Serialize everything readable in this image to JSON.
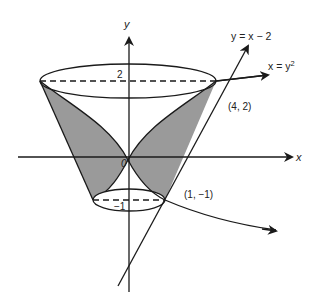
{
  "figure": {
    "axes": {
      "x_label": "x",
      "y_label": "y"
    },
    "curves": {
      "line_label": "y = x − 2",
      "parabola_label_prefix": "x = y",
      "parabola_label_exp": "2"
    },
    "ticks": {
      "y_top": "2",
      "y_bottom": "−1",
      "origin": "0"
    },
    "points": [
      {
        "label": "(4, 2)"
      },
      {
        "label": "(1, −1)"
      }
    ],
    "colors": {
      "shade": "#9a9a9a",
      "stroke": "#1a1a1a",
      "background": "#ffffff"
    }
  }
}
